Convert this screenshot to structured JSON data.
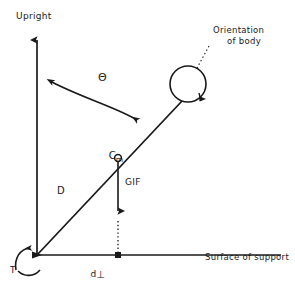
{
  "figure": {
    "background_color": "#ffffff",
    "ink_color": "#1a1a1a"
  },
  "labels": {
    "upright": "Upright",
    "orientation_line1": "Orientation",
    "orientation_line2": "of body",
    "theta": "Θ",
    "cm_symbol": "C",
    "cm_subscript": "m",
    "gif": "GIF",
    "distance_d": "D",
    "d_perp_base": "d",
    "d_perp_symbol": "⊥",
    "torque": "T",
    "surface": "Surface of support"
  },
  "geometry": {
    "origin": {
      "x": 37,
      "y": 255
    },
    "vertical_axis_top": {
      "x": 37,
      "y": 35
    },
    "horizontal_axis_right": {
      "x": 281,
      "y": 255
    },
    "body_line_end": {
      "x": 182,
      "y": 101
    },
    "center_of_mass": {
      "x": 118,
      "y": 158
    },
    "head_circle": {
      "cx": 188,
      "cy": 84,
      "r": 18
    },
    "gif_arrow_tip": {
      "x": 118,
      "y": 217
    },
    "d_perp_tick": {
      "x": 118,
      "y": 255
    }
  },
  "elements": {
    "vertical_axis_name": "upright-reference-axis",
    "horizontal_axis_name": "surface-of-support-axis",
    "body_line_name": "body-segment-line",
    "theta_arc_name": "theta-angle-arc",
    "gif_vector_name": "gif-force-vector",
    "dotted_projection_name": "gif-projection-dotted-line",
    "torque_arc_name": "torque-arc",
    "leader_name": "orientation-leader-dotted-line"
  }
}
